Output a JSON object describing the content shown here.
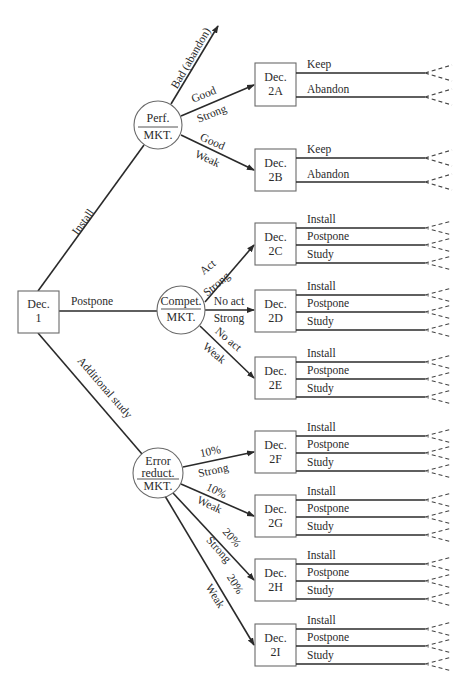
{
  "diagram": {
    "type": "decision-tree",
    "root": {
      "id": "dec1",
      "label_line1": "Dec.",
      "label_line2": "1",
      "branches": {
        "install": "Install",
        "postpone": "Postpone",
        "study": "Additional study"
      }
    },
    "chance_nodes": {
      "perf": {
        "top": "Perf.",
        "bottom": "MKT.",
        "bad_branch": "Bad (abandon)",
        "branch_a_top": "Good",
        "branch_a_bottom": "Strong",
        "branch_b_top": "Good",
        "branch_b_bottom": "Weak"
      },
      "compet": {
        "top": "Compet.",
        "bottom": "MKT.",
        "branch_c_top": "Act",
        "branch_c_bottom": "Strong",
        "branch_d_top": "No act",
        "branch_d_bottom": "Strong",
        "branch_e_top": "No act",
        "branch_e_bottom": "Weak"
      },
      "error": {
        "line1": "Error",
        "line2": "reduct.",
        "bottom": "MKT.",
        "branch_f_top": "10%",
        "branch_f_bottom": "Strong",
        "branch_g_top": "10%",
        "branch_g_bottom": "Weak",
        "branch_h_top": "20%",
        "branch_h_bottom": "Strong",
        "branch_i_top": "20%",
        "branch_i_bottom": "Weak"
      }
    },
    "decision_nodes": {
      "d2a": {
        "line1": "Dec.",
        "line2": "2A",
        "options": [
          "Keep",
          "Abandon"
        ]
      },
      "d2b": {
        "line1": "Dec.",
        "line2": "2B",
        "options": [
          "Keep",
          "Abandon"
        ]
      },
      "d2c": {
        "line1": "Dec.",
        "line2": "2C",
        "options": [
          "Install",
          "Postpone",
          "Study"
        ]
      },
      "d2d": {
        "line1": "Dec.",
        "line2": "2D",
        "options": [
          "Install",
          "Postpone",
          "Study"
        ]
      },
      "d2e": {
        "line1": "Dec.",
        "line2": "2E",
        "options": [
          "Install",
          "Postpone",
          "Study"
        ]
      },
      "d2f": {
        "line1": "Dec.",
        "line2": "2F",
        "options": [
          "Install",
          "Postpone",
          "Study"
        ]
      },
      "d2g": {
        "line1": "Dec.",
        "line2": "2G",
        "options": [
          "Install",
          "Postpone",
          "Study"
        ]
      },
      "d2h": {
        "line1": "Dec.",
        "line2": "2H",
        "options": [
          "Install",
          "Postpone",
          "Study"
        ]
      },
      "d2i": {
        "line1": "Dec.",
        "line2": "2I",
        "options": [
          "Install",
          "Postpone",
          "Study"
        ]
      }
    }
  }
}
